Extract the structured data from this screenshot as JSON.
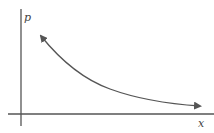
{
  "diagram": {
    "y_axis_label": "p",
    "x_axis_label": "x",
    "curve": {
      "description": "Decreasing convex curve with arrowheads at both ends",
      "shape": "hyperbola-like, double-headed arrow",
      "start_point": [
        41,
        36
      ],
      "end_point": [
        200,
        106
      ]
    },
    "colors": {
      "axis": "#555555",
      "curve": "#555555",
      "label": "#444444",
      "background": "#ffffff"
    }
  }
}
